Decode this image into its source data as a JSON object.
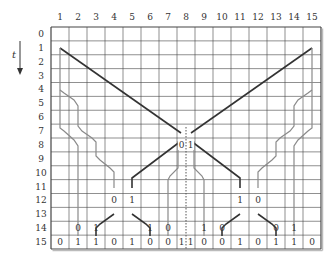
{
  "diagram": {
    "axis_label": "t",
    "columns": [
      "1",
      "2",
      "3",
      "4",
      "5",
      "6",
      "7",
      "8",
      "9",
      "10",
      "11",
      "12",
      "13",
      "14",
      "15"
    ],
    "rows": [
      "0",
      "1",
      "2",
      "3",
      "4",
      "5",
      "6",
      "7",
      "8",
      "9",
      "10",
      "11",
      "12",
      "13",
      "14",
      "15"
    ],
    "cell_values": [
      {
        "row": 8,
        "col": 8,
        "text": "0",
        "side": "left"
      },
      {
        "row": 8,
        "col": 8,
        "text": "1",
        "side": "right"
      },
      {
        "row": 12,
        "col": 4,
        "text": "0"
      },
      {
        "row": 12,
        "col": 5,
        "text": "1"
      },
      {
        "row": 12,
        "col": 11,
        "text": "1"
      },
      {
        "row": 12,
        "col": 12,
        "text": "0"
      },
      {
        "row": 14,
        "col": 2,
        "text": "0"
      },
      {
        "row": 14,
        "col": 3,
        "text": "1"
      },
      {
        "row": 14,
        "col": 6,
        "text": "1"
      },
      {
        "row": 14,
        "col": 7,
        "text": "0"
      },
      {
        "row": 14,
        "col": 9,
        "text": "1"
      },
      {
        "row": 14,
        "col": 10,
        "text": "0"
      },
      {
        "row": 14,
        "col": 13,
        "text": "0"
      },
      {
        "row": 14,
        "col": 14,
        "text": "1"
      },
      {
        "row": 15,
        "col": 1,
        "text": "0"
      },
      {
        "row": 15,
        "col": 2,
        "text": "1"
      },
      {
        "row": 15,
        "col": 3,
        "text": "1"
      },
      {
        "row": 15,
        "col": 4,
        "text": "0"
      },
      {
        "row": 15,
        "col": 5,
        "text": "1"
      },
      {
        "row": 15,
        "col": 6,
        "text": "0"
      },
      {
        "row": 15,
        "col": 7,
        "text": "0"
      },
      {
        "row": 15,
        "col": 8,
        "text": "1",
        "side": "left"
      },
      {
        "row": 15,
        "col": 8,
        "text": "1",
        "side": "right"
      },
      {
        "row": 15,
        "col": 9,
        "text": "0"
      },
      {
        "row": 15,
        "col": 10,
        "text": "0"
      },
      {
        "row": 15,
        "col": 11,
        "text": "1"
      },
      {
        "row": 15,
        "col": 12,
        "text": "0"
      },
      {
        "row": 15,
        "col": 13,
        "text": "1"
      },
      {
        "row": 15,
        "col": 14,
        "text": "1"
      },
      {
        "row": 15,
        "col": 15,
        "text": "0"
      }
    ],
    "colors": {
      "grid": "#444444",
      "main_path": "#333333",
      "branch_path": "#888888",
      "divider": "#555555"
    }
  }
}
